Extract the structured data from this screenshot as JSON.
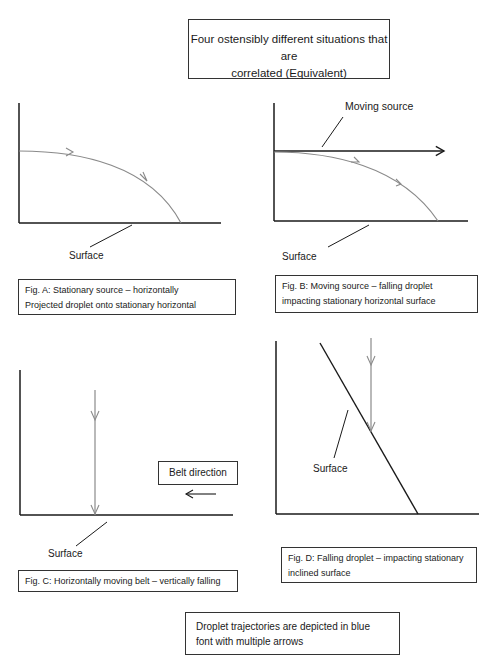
{
  "title": {
    "line1": "Four ostensibly different situations that are",
    "line2": "correlated (Equivalent)"
  },
  "figures": {
    "a": {
      "surface_label": "Surface",
      "caption_line1": "Fig. A: Stationary source – horizontally",
      "caption_line2": "Projected droplet onto stationary horizontal"
    },
    "b": {
      "source_label": "Moving source",
      "surface_label": "Surface",
      "caption_line1": "Fig. B: Moving source – falling droplet",
      "caption_line2": "impacting stationary horizontal surface"
    },
    "c": {
      "belt_label": "Belt direction",
      "surface_label": "Surface",
      "caption": "Fig. C: Horizontally moving belt – vertically falling"
    },
    "d": {
      "surface_label": "Surface",
      "caption_line1": "Fig. D: Falling droplet – impacting stationary",
      "caption_line2": "inclined surface"
    }
  },
  "note": {
    "line1": "Droplet trajectories are depicted in blue",
    "line2": "font with multiple arrows"
  },
  "colors": {
    "line": "#1a1a1a",
    "trajectory": "#8a8a8a"
  }
}
